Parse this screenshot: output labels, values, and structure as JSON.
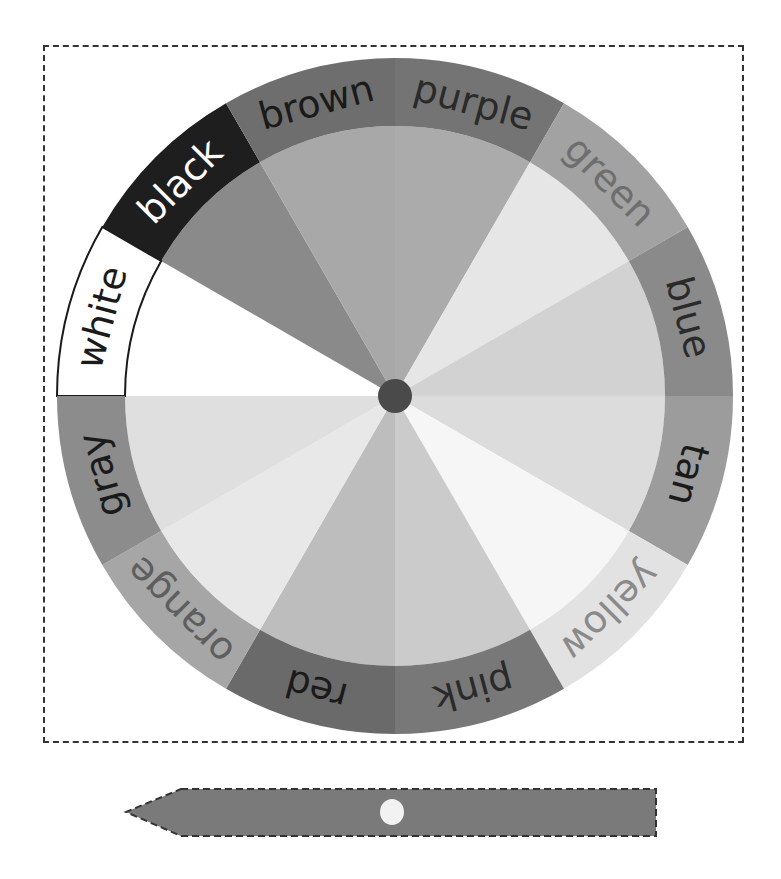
{
  "wheel": {
    "center": [
      395,
      396
    ],
    "outer_radius": 338,
    "inner_radius": 270,
    "hub_radius": 17,
    "hub_color": "#4a4a4a",
    "start_angle_deg": 180,
    "segments": [
      {
        "label": "white",
        "ring": "#ffffff",
        "inner": "#ffffff",
        "text": "#1a1a1a",
        "outlined": true
      },
      {
        "label": "black",
        "ring": "#1e1e1e",
        "inner": "#8a8a8a",
        "text": "#ffffff"
      },
      {
        "label": "brown",
        "ring": "#6e6e6e",
        "inner": "#a8a8a8",
        "text": "#1a1a1a"
      },
      {
        "label": "purple",
        "ring": "#747474",
        "inner": "#ababab",
        "text": "#2a2a2a"
      },
      {
        "label": "green",
        "ring": "#a2a2a2",
        "inner": "#e6e6e6",
        "text": "#6e6e6e"
      },
      {
        "label": "blue",
        "ring": "#8a8a8a",
        "inner": "#d2d2d2",
        "text": "#2a2a2a"
      },
      {
        "label": "tan",
        "ring": "#9c9c9c",
        "inner": "#dcdcdc",
        "text": "#1a1a1a"
      },
      {
        "label": "yellow",
        "ring": "#e2e2e2",
        "inner": "#f6f6f6",
        "text": "#8a8a8a"
      },
      {
        "label": "pink",
        "ring": "#787878",
        "inner": "#cbcbcb",
        "text": "#2a2a2a"
      },
      {
        "label": "red",
        "ring": "#6a6a6a",
        "inner": "#bdbdbd",
        "text": "#1a1a1a"
      },
      {
        "label": "orange",
        "ring": "#a6a6a6",
        "inner": "#e8e8e8",
        "text": "#5e5e5e"
      },
      {
        "label": "gray",
        "ring": "#8c8c8c",
        "inner": "#dfdfdf",
        "text": "#1a1a1a"
      }
    ]
  },
  "pointer": {
    "fill": "#7a7a7a",
    "hole_color": "#f2f2f2"
  }
}
